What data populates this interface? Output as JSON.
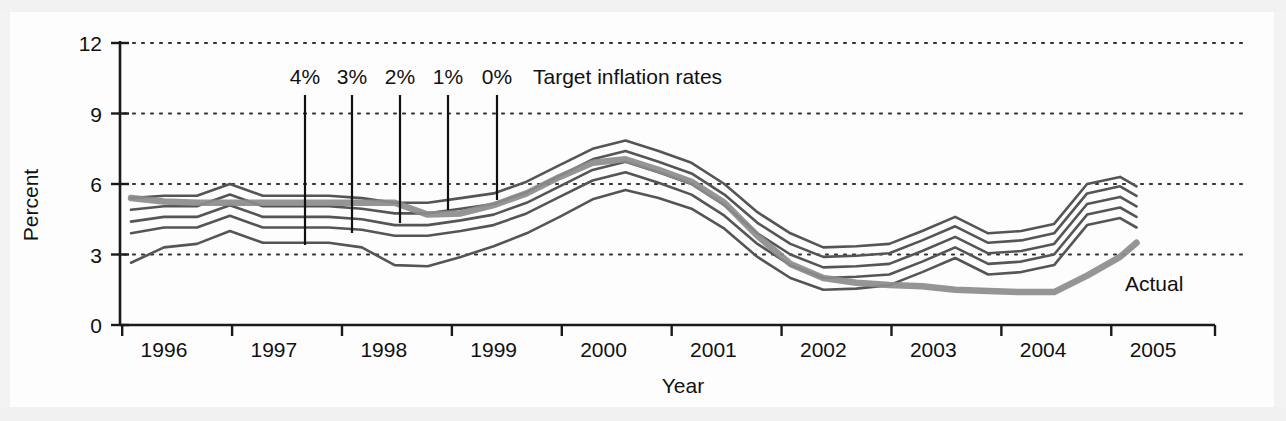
{
  "chart_data": {
    "type": "line",
    "title": "",
    "xlabel": "Year",
    "ylabel": "Percent",
    "xlim": [
      1995.6,
      2005.3
    ],
    "ylim": [
      0,
      12
    ],
    "yticks": [
      0,
      3,
      6,
      9,
      12
    ],
    "xticks": [
      1996,
      1997,
      1998,
      1999,
      2000,
      2001,
      2002,
      2003,
      2004,
      2005
    ],
    "grid": "horizontal-dotted",
    "legend_position": "inline-annotations",
    "annotations": {
      "target_group_label": "Target inflation rates",
      "target_labels": [
        "4%",
        "3%",
        "2%",
        "1%",
        "0%"
      ],
      "actual_label": "Actual"
    },
    "x": [
      1995.7,
      1996.0,
      1996.3,
      1996.6,
      1996.9,
      1997.2,
      1997.5,
      1997.8,
      1998.1,
      1998.4,
      1998.7,
      1999.0,
      1999.3,
      1999.6,
      1999.9,
      2000.2,
      2000.5,
      2000.8,
      2001.1,
      2001.4,
      2001.7,
      2002.0,
      2002.3,
      2002.6,
      2002.9,
      2003.2,
      2003.5,
      2003.8,
      2004.1,
      2004.4,
      2004.7,
      2004.85
    ],
    "series": [
      {
        "name": "Actual",
        "style": "thick-gray",
        "color": "#8c8c8c",
        "values": [
          5.4,
          5.25,
          5.2,
          5.2,
          5.2,
          5.2,
          5.2,
          5.2,
          5.2,
          4.7,
          4.75,
          5.1,
          5.6,
          6.3,
          6.9,
          7.05,
          6.6,
          6.1,
          5.2,
          3.8,
          2.6,
          2.0,
          1.8,
          1.7,
          1.65,
          1.5,
          1.45,
          1.4,
          1.4,
          2.1,
          2.9,
          3.5
        ]
      },
      {
        "name": "Target 0%",
        "style": "thin-dark",
        "color": "#555555",
        "values": [
          5.4,
          5.5,
          5.5,
          6.0,
          5.5,
          5.5,
          5.5,
          5.4,
          5.2,
          5.2,
          5.4,
          5.6,
          6.1,
          6.8,
          7.5,
          7.85,
          7.4,
          6.9,
          6.0,
          4.8,
          3.9,
          3.3,
          3.35,
          3.45,
          4.0,
          4.6,
          3.9,
          4.0,
          4.3,
          6.0,
          6.3,
          5.9
        ]
      },
      {
        "name": "Target 1%",
        "style": "thin-dark",
        "color": "#555555",
        "values": [
          4.9,
          5.05,
          5.05,
          5.55,
          5.05,
          5.05,
          5.05,
          4.95,
          4.75,
          4.75,
          4.95,
          5.15,
          5.65,
          6.35,
          7.05,
          7.4,
          6.95,
          6.45,
          5.55,
          4.35,
          3.45,
          2.9,
          2.95,
          3.05,
          3.6,
          4.2,
          3.5,
          3.6,
          3.9,
          5.6,
          5.9,
          5.5
        ]
      },
      {
        "name": "Target 2%",
        "style": "thin-dark",
        "color": "#555555",
        "values": [
          4.4,
          4.6,
          4.6,
          5.1,
          4.6,
          4.6,
          4.6,
          4.5,
          4.25,
          4.25,
          4.45,
          4.7,
          5.2,
          5.9,
          6.6,
          6.95,
          6.5,
          6.0,
          5.1,
          3.9,
          3.0,
          2.45,
          2.5,
          2.6,
          3.15,
          3.75,
          3.05,
          3.15,
          3.45,
          5.15,
          5.45,
          5.05
        ]
      },
      {
        "name": "Target 3%",
        "style": "thin-dark",
        "color": "#555555",
        "values": [
          3.9,
          4.15,
          4.15,
          4.65,
          4.15,
          4.15,
          4.15,
          4.05,
          3.8,
          3.8,
          4.0,
          4.25,
          4.75,
          5.45,
          6.15,
          6.5,
          6.05,
          5.55,
          4.65,
          3.45,
          2.55,
          2.0,
          2.05,
          2.15,
          2.7,
          3.3,
          2.6,
          2.7,
          3.0,
          4.7,
          5.0,
          4.6
        ]
      },
      {
        "name": "Target 4%",
        "style": "thin-dark",
        "color": "#555555",
        "values": [
          2.65,
          3.3,
          3.45,
          4.0,
          3.5,
          3.5,
          3.5,
          3.3,
          2.55,
          2.5,
          2.9,
          3.35,
          3.9,
          4.6,
          5.35,
          5.75,
          5.4,
          4.95,
          4.1,
          2.9,
          2.0,
          1.5,
          1.55,
          1.7,
          2.25,
          2.85,
          2.15,
          2.25,
          2.55,
          4.25,
          4.55,
          4.15
        ]
      }
    ],
    "target_pointers": [
      {
        "label": "4%",
        "x_px": 305,
        "y_top_px": 95,
        "y_bottom_px": 245
      },
      {
        "label": "3%",
        "x_px": 352,
        "y_top_px": 95,
        "y_bottom_px": 233
      },
      {
        "label": "2%",
        "x_px": 400,
        "y_top_px": 95,
        "y_bottom_px": 223
      },
      {
        "label": "1%",
        "x_px": 448,
        "y_top_px": 95,
        "y_bottom_px": 210
      },
      {
        "label": "0%",
        "x_px": 497,
        "y_top_px": 95,
        "y_bottom_px": 200
      }
    ]
  },
  "axes": {
    "y_label": "Percent",
    "x_label": "Year",
    "y_ticks": [
      "12",
      "9",
      "6",
      "3",
      "0"
    ],
    "x_ticks": [
      "1996",
      "1997",
      "1998",
      "1999",
      "2000",
      "2001",
      "2002",
      "2003",
      "2004",
      "2005"
    ]
  },
  "colors": {
    "actual_line": "#8c8c8c",
    "target_line": "#555555",
    "axis": "#1a1a1a",
    "grid": "#333333",
    "page_background": "#fbfbfb",
    "plot_background": "#fdfdfd"
  }
}
